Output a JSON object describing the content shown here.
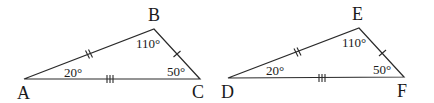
{
  "figure": {
    "triangles": [
      {
        "name": "ABC",
        "vertices": {
          "A": {
            "label": "A",
            "x": 24,
            "y": 79,
            "lx": 17,
            "ly": 99
          },
          "B": {
            "label": "B",
            "x": 154,
            "y": 29,
            "lx": 148,
            "ly": 21
          },
          "C": {
            "label": "C",
            "x": 200,
            "y": 79,
            "lx": 192,
            "ly": 98
          }
        },
        "angles": {
          "A": {
            "label": "20°",
            "x": 64,
            "y": 77
          },
          "B": {
            "label": "110°",
            "x": 136,
            "y": 48
          },
          "C": {
            "label": "50°",
            "x": 167,
            "y": 76
          }
        },
        "ticks": {
          "AB": 2,
          "BC": 1,
          "AC": 3
        }
      },
      {
        "name": "DEF",
        "vertices": {
          "D": {
            "label": "D",
            "x": 228,
            "y": 78,
            "lx": 221,
            "ly": 98
          },
          "E": {
            "label": "E",
            "x": 359,
            "y": 28,
            "lx": 352,
            "ly": 20
          },
          "F": {
            "label": "F",
            "x": 404,
            "y": 77,
            "lx": 397,
            "ly": 97
          }
        },
        "angles": {
          "D": {
            "label": "20°",
            "x": 266,
            "y": 75
          },
          "E": {
            "label": "110°",
            "x": 342,
            "y": 47
          },
          "F": {
            "label": "50°",
            "x": 373,
            "y": 74
          }
        },
        "ticks": {
          "DE": 2,
          "EF": 1,
          "DF": 3
        }
      }
    ]
  }
}
